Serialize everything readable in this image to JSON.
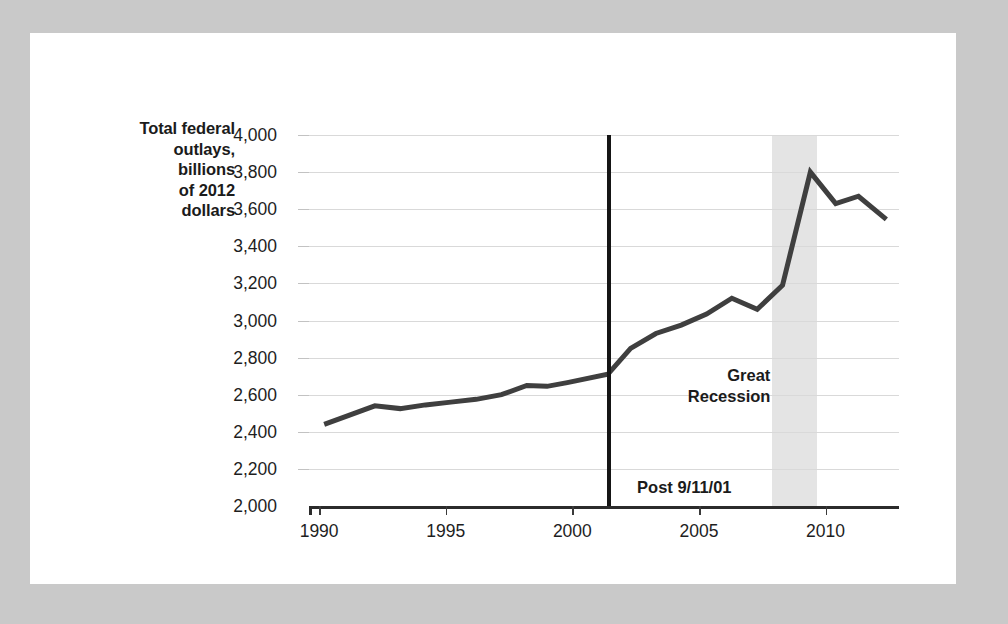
{
  "figure": {
    "background_color": "#c9c9c9",
    "card_color": "#ffffff",
    "line_color": "#3f3f3f",
    "band_color": "#e4e4e4",
    "rule_color": "#151515"
  },
  "axis_title_lines": [
    "Total federal",
    "outlays,",
    "billions",
    "of 2012",
    "dollars"
  ],
  "annotations": [
    {
      "id": "great-recession",
      "lines": [
        "Great",
        "Recession"
      ]
    },
    {
      "id": "post-911",
      "lines": [
        "Post 9/11/01"
      ]
    }
  ],
  "chart_data": {
    "type": "line",
    "title": "",
    "xlabel": "",
    "ylabel": "Total federal outlays, billions of 2012 dollars",
    "xlim": [
      1989.6,
      2012.9
    ],
    "ylim": [
      2000,
      4000
    ],
    "grid": true,
    "legend": "none",
    "xticks": [
      1990,
      1995,
      2000,
      2005,
      2010
    ],
    "xtick_labels": [
      "1990",
      "1995",
      "2000",
      "2005",
      "2010"
    ],
    "yticks": [
      2000,
      2200,
      2400,
      2600,
      2800,
      3000,
      3200,
      3400,
      3600,
      3800,
      4000
    ],
    "ytick_labels": [
      "2,000",
      "2,200",
      "2,400",
      "2,600",
      "2,800",
      "3,000",
      "3,200",
      "3,400",
      "3,600",
      "3,800",
      "4,000"
    ],
    "series": [
      {
        "name": "Total federal outlays",
        "color": "#3f3f3f",
        "x": [
          1990.2,
          1991.2,
          1992.2,
          1993.2,
          1994.2,
          1995.2,
          1996.2,
          1997.2,
          1998.2,
          1999.0,
          1999.8,
          2001.4,
          2002.3,
          2003.3,
          2004.3,
          2005.3,
          2006.3,
          2007.3,
          2008.3,
          2009.4,
          2010.4,
          2011.3,
          2012.4
        ],
        "y": [
          2440,
          2490,
          2540,
          2525,
          2545,
          2560,
          2575,
          2600,
          2650,
          2645,
          2665,
          2710,
          2850,
          2930,
          2975,
          3035,
          3120,
          3060,
          3190,
          3800,
          3630,
          3670,
          3545
        ]
      }
    ],
    "shaded_regions": [
      {
        "label": "Great Recession",
        "x0": 2007.9,
        "x1": 2009.65,
        "color": "#e4e4e4"
      }
    ],
    "vertical_rules": [
      {
        "label": "Post 9/11/01",
        "x": 2001.45,
        "color": "#151515"
      }
    ]
  }
}
